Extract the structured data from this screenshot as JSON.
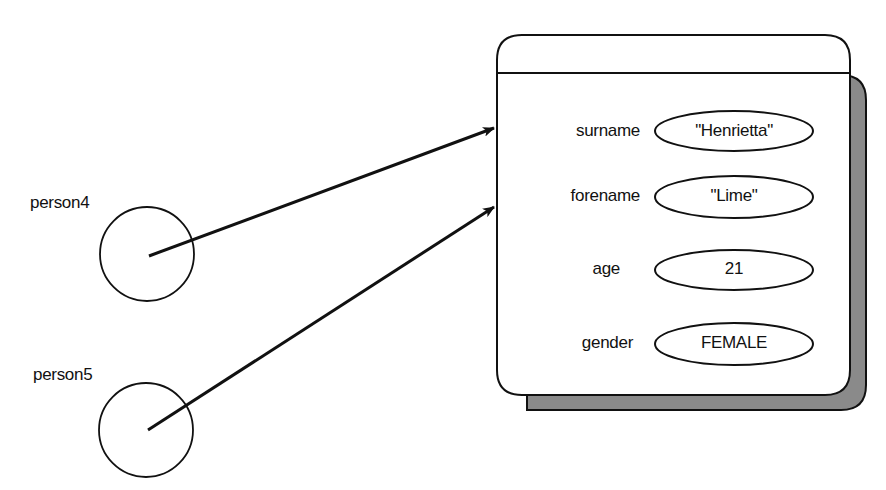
{
  "diagram": {
    "type": "object-reference-diagram",
    "variables": [
      {
        "name": "person4",
        "label_x": 30,
        "label_y": 202,
        "cx": 147,
        "cy": 254,
        "r": 47
      },
      {
        "name": "person5",
        "label_x": 33,
        "label_y": 374,
        "cx": 146,
        "cy": 430,
        "r": 47
      }
    ],
    "object": {
      "fields": [
        {
          "label": "surname",
          "value": "\"Henrietta\"",
          "cy": 131
        },
        {
          "label": "forename",
          "value": "\"Lime\"",
          "cy": 197
        },
        {
          "label": "age",
          "value": "21",
          "cy": 270
        },
        {
          "label": "gender",
          "value": "FEMALE",
          "cy": 344
        }
      ]
    },
    "references": [
      {
        "from": "person4",
        "to": "object"
      },
      {
        "from": "person5",
        "to": "object"
      }
    ],
    "colors": {
      "stroke": "#111111",
      "shadow": "#8a8a8a",
      "background": "#ffffff"
    }
  }
}
